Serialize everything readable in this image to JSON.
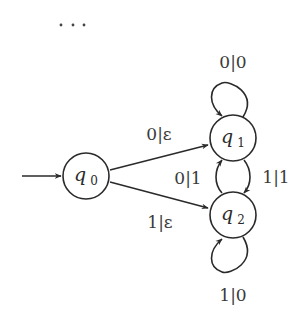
{
  "diagram": {
    "type": "finite-state-transducer",
    "ellipsis": "…",
    "start_state": "q0",
    "states": [
      {
        "id": "q0",
        "name": "q",
        "subscript": "0",
        "cx": 86,
        "cy": 176,
        "r": 23
      },
      {
        "id": "q1",
        "name": "q",
        "subscript": "1",
        "cx": 233,
        "cy": 138,
        "r": 23
      },
      {
        "id": "q2",
        "name": "q",
        "subscript": "2",
        "cx": 233,
        "cy": 215,
        "r": 23
      }
    ],
    "transitions": [
      {
        "from": "q0",
        "to": "q1",
        "label": "0|ε"
      },
      {
        "from": "q0",
        "to": "q2",
        "label": "1|ε"
      },
      {
        "from": "q1",
        "to": "q1",
        "label": "0|0"
      },
      {
        "from": "q1",
        "to": "q2",
        "label": "1|1"
      },
      {
        "from": "q2",
        "to": "q1",
        "label": "0|1"
      },
      {
        "from": "q2",
        "to": "q2",
        "label": "1|0"
      }
    ]
  }
}
